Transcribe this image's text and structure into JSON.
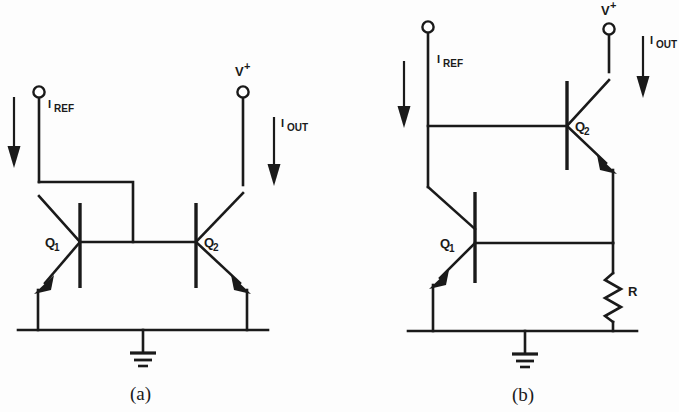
{
  "figure": {
    "type": "schematic-diagram",
    "background_color": "#fdfdfd",
    "line_color": "#1a1a1a"
  },
  "circuits": [
    {
      "id": "a",
      "caption": "(a)",
      "description": "Basic two-transistor current mirror with diode-connected Q1",
      "labels": {
        "iref_i": "I",
        "iref_sub": "REF",
        "iout_i": "I",
        "iout_sub": "OUT",
        "vplus_v": "V",
        "vplus_sup": "+",
        "q1_q": "Q",
        "q1_sub": "1",
        "q2_q": "Q",
        "q2_sub": "2"
      },
      "components": [
        "terminal-iref",
        "terminal-vplus",
        "transistor-q1",
        "transistor-q2",
        "ground"
      ]
    },
    {
      "id": "b",
      "caption": "(b)",
      "description": "Current mirror with emitter degeneration resistor R",
      "labels": {
        "iref_i": "I",
        "iref_sub": "REF",
        "iout_i": "I",
        "iout_sub": "OUT",
        "vplus_v": "V",
        "vplus_sup": "+",
        "q1_q": "Q",
        "q1_sub": "1",
        "q2_q": "Q",
        "q2_sub": "2",
        "resistor": "R"
      },
      "components": [
        "terminal-iref",
        "terminal-vplus",
        "transistor-q1",
        "transistor-q2",
        "resistor-r",
        "ground"
      ]
    }
  ]
}
